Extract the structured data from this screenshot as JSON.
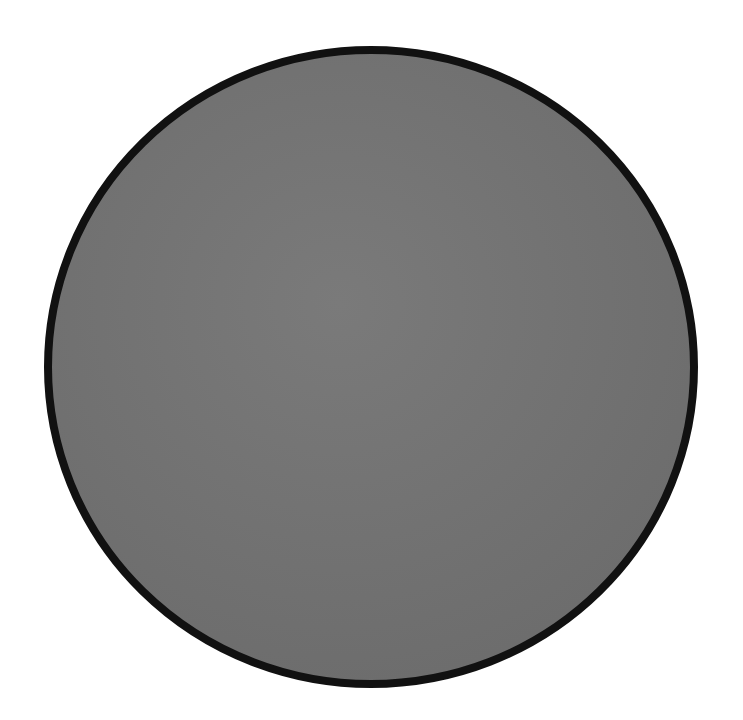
{
  "canvas": {
    "width": 743,
    "height": 720,
    "background": "#ffffff"
  },
  "shape": {
    "type": "circle",
    "fill": "#737373",
    "stroke": "#111111",
    "stroke_width": 8,
    "cx": 371,
    "cy": 367,
    "rx": 323,
    "ry": 317
  }
}
